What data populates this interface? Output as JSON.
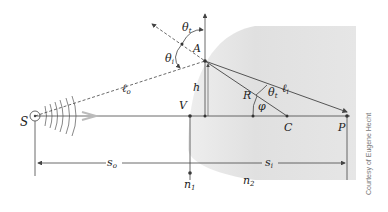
{
  "diagram": {
    "labels": {
      "source": "S",
      "vertex": "V",
      "point_a": "A",
      "height": "h",
      "radius": "R",
      "center": "C",
      "image_point": "P",
      "object_path": "ℓ",
      "object_path_sub": "o",
      "image_path": "ℓ",
      "image_path_sub": "i",
      "theta_i": "θ",
      "theta_i_sub": "i",
      "theta_t": "θ",
      "theta_t_sub": "t",
      "theta_t2": "θ",
      "theta_t2_sub": "t",
      "phi": "φ",
      "object_distance": "s",
      "object_distance_sub": "o",
      "image_distance": "s",
      "image_distance_sub": "i",
      "n1": "n",
      "n1_sub": "1",
      "n2": "n",
      "n2_sub": "2"
    },
    "credit": "Courtesy of Eugene Hecht",
    "colors": {
      "medium_fill": "#e2e2e2",
      "lines": "#444444",
      "arrow": "#bbbbbb"
    }
  }
}
